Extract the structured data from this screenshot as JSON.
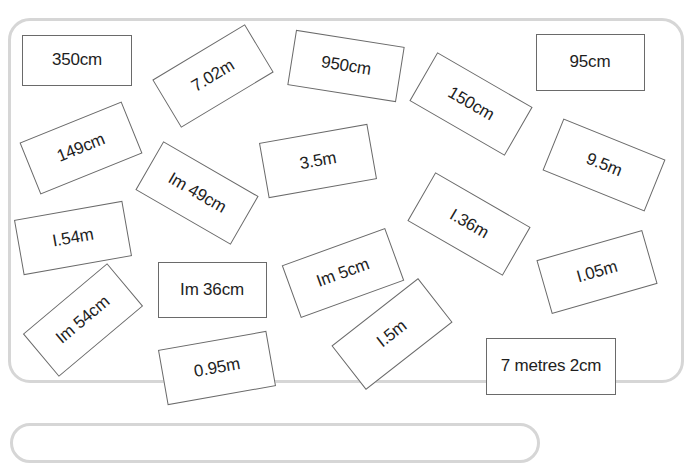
{
  "cards": [
    {
      "label": "350cm",
      "cx": 77,
      "cy": 60,
      "w": 110,
      "h": 51,
      "rot": 0
    },
    {
      "label": "7.02m",
      "cx": 213,
      "cy": 76,
      "w": 108,
      "h": 56,
      "rot": -31
    },
    {
      "label": "950cm",
      "cx": 346,
      "cy": 66,
      "w": 110,
      "h": 56,
      "rot": 9
    },
    {
      "label": "150cm",
      "cx": 471,
      "cy": 104,
      "w": 110,
      "h": 56,
      "rot": 30
    },
    {
      "label": "95cm",
      "cx": 590,
      "cy": 62,
      "w": 109,
      "h": 57,
      "rot": 0
    },
    {
      "label": "149cm",
      "cx": 81,
      "cy": 148,
      "w": 110,
      "h": 56,
      "rot": -22
    },
    {
      "label": "Im 49cm",
      "cx": 197,
      "cy": 193,
      "w": 110,
      "h": 56,
      "rot": 30
    },
    {
      "label": "3.5m",
      "cx": 318,
      "cy": 161,
      "w": 110,
      "h": 56,
      "rot": -10
    },
    {
      "label": "9.5m",
      "cx": 604,
      "cy": 165,
      "w": 110,
      "h": 56,
      "rot": 22
    },
    {
      "label": "I.54m",
      "cx": 73,
      "cy": 238,
      "w": 110,
      "h": 56,
      "rot": -10
    },
    {
      "label": "I.36m",
      "cx": 469,
      "cy": 224,
      "w": 110,
      "h": 56,
      "rot": 30
    },
    {
      "label": "Im 36cm",
      "cx": 212,
      "cy": 290,
      "w": 109,
      "h": 56,
      "rot": 0
    },
    {
      "label": "Im 5cm",
      "cx": 343,
      "cy": 273,
      "w": 110,
      "h": 56,
      "rot": -20
    },
    {
      "label": "I.05m",
      "cx": 597,
      "cy": 272,
      "w": 110,
      "h": 56,
      "rot": -16
    },
    {
      "label": "Im 54cm",
      "cx": 83,
      "cy": 320,
      "w": 110,
      "h": 56,
      "rot": -40
    },
    {
      "label": "0.95m",
      "cx": 217,
      "cy": 368,
      "w": 110,
      "h": 56,
      "rot": -10
    },
    {
      "label": "I.5m",
      "cx": 392,
      "cy": 334,
      "w": 110,
      "h": 56,
      "rot": -38
    },
    {
      "label": "7 metres 2cm",
      "cx": 551,
      "cy": 366,
      "w": 130,
      "h": 57,
      "rot": 0
    }
  ],
  "colors": {
    "panel_border": "#d6d6d6",
    "card_border": "#6a6a6a",
    "text": "#1e1e1e"
  }
}
